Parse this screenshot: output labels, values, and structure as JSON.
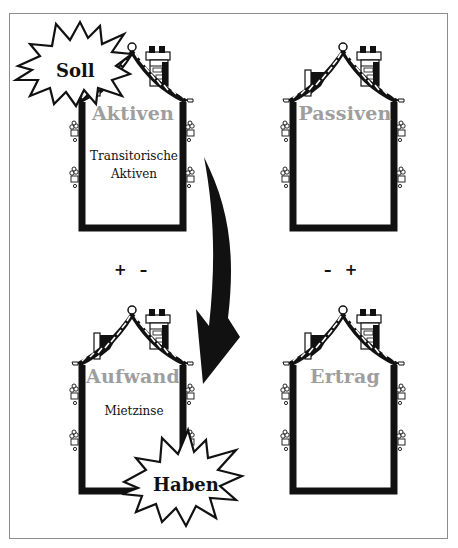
{
  "diagram": {
    "type": "account-houses",
    "colors": {
      "outline": "#111111",
      "title_gray": "#9e9e9e",
      "frame": "#8c8c8c",
      "background": "#ffffff"
    },
    "houses": [
      {
        "id": "aktiven",
        "title": "Aktiven",
        "body_lines": [
          "Transitorische",
          "Aktiven"
        ]
      },
      {
        "id": "passiven",
        "title": "Passiven",
        "body_lines": []
      },
      {
        "id": "aufwand",
        "title": "Aufwand",
        "body_lines": [
          "Mietzinse"
        ]
      },
      {
        "id": "ertrag",
        "title": "Ertrag",
        "body_lines": []
      }
    ],
    "signs": {
      "left": "+ –",
      "right": "– +"
    },
    "bursts": {
      "soll": "Soll",
      "haben": "Haben"
    },
    "arrow": {
      "from": "aktiven",
      "to": "aufwand",
      "direction": "down"
    }
  }
}
